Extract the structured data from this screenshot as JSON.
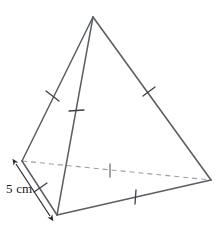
{
  "figure": {
    "name": "tetrahedron-diagram",
    "shape_type": "triangular-pyramid",
    "title": "",
    "stroke_color": "#5a5f66",
    "hidden_edge_color": "#9aa0a6",
    "label_color": "#1a1a1a",
    "background_color": "#ffffff",
    "dimension": {
      "value": "5 cm",
      "measure_edge": "front-left-base-edge",
      "arrow_style": "double-headed"
    },
    "vertices": {
      "apex": {
        "name": "apex",
        "x": 93,
        "y": 17
      },
      "back_left": {
        "name": "back-left-vertex",
        "x": 22,
        "y": 161
      },
      "front_bottom": {
        "name": "front-bottom-vertex",
        "x": 57,
        "y": 215
      },
      "right": {
        "name": "right-vertex",
        "x": 211,
        "y": 180
      }
    },
    "edges": [
      {
        "name": "apex-to-back-left",
        "style": "solid",
        "x1": 93,
        "y1": 17,
        "x2": 22,
        "y2": 161,
        "tick": {
          "x": 52,
          "y": 96,
          "angle": -26
        }
      },
      {
        "name": "apex-to-front-bottom",
        "style": "solid",
        "x1": 93,
        "y1": 17,
        "x2": 57,
        "y2": 215,
        "tick": {
          "x": 76,
          "y": 111,
          "angle": 0
        }
      },
      {
        "name": "apex-to-right",
        "style": "solid",
        "x1": 93,
        "y1": 17,
        "x2": 211,
        "y2": 180,
        "tick": {
          "x": 149,
          "y": 92,
          "angle": 20
        }
      },
      {
        "name": "back-left-to-front-bottom",
        "style": "solid",
        "x1": 22,
        "y1": 161,
        "x2": 57,
        "y2": 215,
        "tick": {
          "x": 40,
          "y": 188,
          "angle": -48
        }
      },
      {
        "name": "front-bottom-to-right",
        "style": "solid",
        "x1": 57,
        "y1": 215,
        "x2": 211,
        "y2": 180,
        "tick": {
          "x": 135,
          "y": 197,
          "angle": 0
        }
      },
      {
        "name": "back-left-to-right-hidden",
        "style": "dashed",
        "x1": 22,
        "y1": 161,
        "x2": 211,
        "y2": 180,
        "tick": {
          "x": 110,
          "y": 170,
          "angle": 0
        }
      }
    ]
  }
}
